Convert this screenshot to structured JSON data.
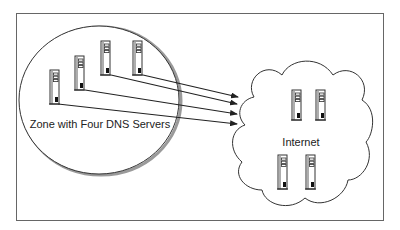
{
  "diagram": {
    "zone_label": "Zone with Four DNS Servers",
    "internet_label": "Internet",
    "zone_servers": [
      {
        "x": 50,
        "y": 70,
        "h": 34
      },
      {
        "x": 75,
        "y": 56,
        "h": 34
      },
      {
        "x": 101,
        "y": 41,
        "h": 34
      },
      {
        "x": 133,
        "y": 41,
        "h": 34
      }
    ],
    "internet_servers": [
      {
        "x": 292,
        "y": 90,
        "h": 30
      },
      {
        "x": 316,
        "y": 90,
        "h": 30
      },
      {
        "x": 278,
        "y": 155,
        "h": 34
      },
      {
        "x": 306,
        "y": 155,
        "h": 34
      }
    ],
    "arrows": [
      {
        "x1": 143,
        "y1": 75,
        "x2": 238,
        "y2": 97
      },
      {
        "x1": 111,
        "y1": 75,
        "x2": 237,
        "y2": 104
      },
      {
        "x1": 85,
        "y1": 90,
        "x2": 237,
        "y2": 114
      },
      {
        "x1": 58,
        "y1": 104,
        "x2": 237,
        "y2": 124
      }
    ],
    "colors": {
      "line": "#222222",
      "frame": "#666666",
      "shadow": "#9a9a9a",
      "background": "#ffffff"
    }
  }
}
